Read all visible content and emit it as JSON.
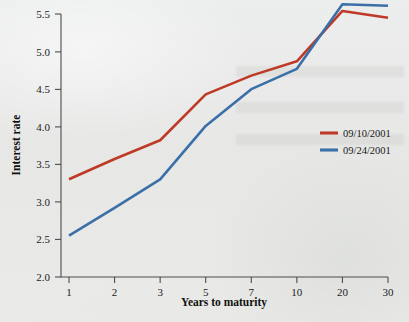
{
  "chart_data": {
    "type": "line",
    "title": "",
    "subtitle": "",
    "xlabel": "Years to maturity",
    "ylabel": "Interest rate",
    "categories": [
      "1",
      "2",
      "3",
      "5",
      "7",
      "10",
      "20",
      "30"
    ],
    "ylim": [
      2.0,
      5.5
    ],
    "ytick_labels": [
      "2.0",
      "2.5",
      "3.0",
      "3.5",
      "4.0",
      "4.5",
      "5.0",
      "5.5"
    ],
    "ytick_values": [
      2.0,
      2.5,
      3.0,
      3.5,
      4.0,
      4.5,
      5.0,
      5.5
    ],
    "grid": false,
    "legend_position": "center-right",
    "axis_style": "left-and-bottom-only",
    "x_scale": "categorical",
    "series": [
      {
        "name": "09/10/2001",
        "color": "#be3a26",
        "values": [
          3.3,
          3.57,
          3.82,
          4.43,
          4.68,
          4.87,
          5.54,
          5.45
        ]
      },
      {
        "name": "09/24/2001",
        "color": "#3b6fa8",
        "values": [
          2.55,
          2.92,
          3.3,
          4.01,
          4.5,
          4.77,
          5.63,
          5.61
        ]
      }
    ]
  },
  "figure": {
    "background_color": "#e9eae8",
    "axis_color": "#4c4c4c",
    "text_color": "#1b1b1b"
  }
}
